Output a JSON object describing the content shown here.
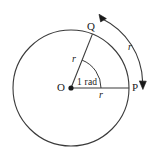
{
  "figure": {
    "type": "geometry-diagram",
    "background_color": "#ffffff",
    "stroke_color": "#3a3a3a",
    "text_color": "#1a1a1a",
    "circle": {
      "center_label": "O",
      "center_x": 71,
      "center_y": 88,
      "radius": 58
    },
    "points": [
      {
        "name": "point-o",
        "label": "O",
        "x": 71,
        "y": 88,
        "dot": true
      },
      {
        "name": "point-p",
        "label": "P",
        "x": 129,
        "y": 88,
        "dot": false
      },
      {
        "name": "point-q",
        "label": "Q",
        "x": 92,
        "y": 31,
        "dot": false
      }
    ],
    "labels": {
      "center": "O",
      "point_p": "P",
      "point_q": "Q",
      "radius_horizontal": "r",
      "radius_slanted": "r",
      "arc_length": "r",
      "angle": "1 rad"
    },
    "angle": {
      "value": 1,
      "unit": "rad",
      "degrees": 57.2958,
      "arc_radius": 30
    },
    "arc_arrow": {
      "double_headed": true,
      "from": "Q",
      "to": "P",
      "offset": 14
    }
  }
}
